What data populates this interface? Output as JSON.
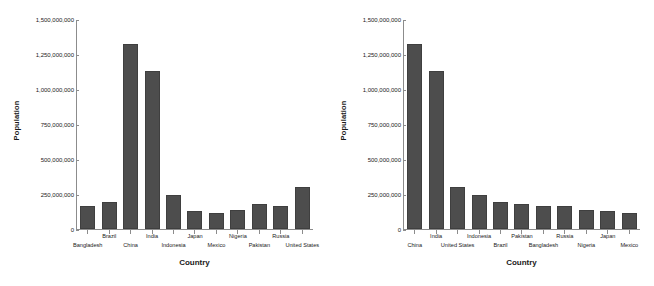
{
  "chart_data": [
    {
      "id": "left",
      "type": "bar",
      "title": "",
      "xlabel": "Country",
      "ylabel": "Population",
      "ylim": [
        0,
        1500000000
      ],
      "grid": false,
      "legend": null,
      "bar_color": "#4d4d4d",
      "sorted": "alphabetical",
      "ytick_labels": [
        "1,500,000,000",
        "1,250,000,000",
        "1,000,000,000",
        "750,000,000",
        "500,000,000",
        "250,000,000",
        "0"
      ],
      "ytick_values": [
        1500000000,
        1250000000,
        1000000000,
        750000000,
        500000000,
        250000000,
        0
      ],
      "categories": [
        "Bangladesh",
        "Brazil",
        "China",
        "India",
        "Indonesia",
        "Japan",
        "Mexico",
        "Nigeria",
        "Pakistan",
        "Russia",
        "United States"
      ],
      "values": [
        163000000,
        196000000,
        1330000000,
        1136000000,
        243000000,
        127000000,
        113000000,
        134000000,
        177000000,
        162000000,
        302000000
      ]
    },
    {
      "id": "right",
      "type": "bar",
      "title": "",
      "xlabel": "Country",
      "ylabel": "Population",
      "ylim": [
        0,
        1500000000
      ],
      "grid": false,
      "legend": null,
      "bar_color": "#4d4d4d",
      "sorted": "descending-by-value",
      "ytick_labels": [
        "1,500,000,000",
        "1,250,000,000",
        "1,000,000,000",
        "750,000,000",
        "500,000,000",
        "250,000,000",
        "0"
      ],
      "ytick_values": [
        1500000000,
        1250000000,
        1000000000,
        750000000,
        500000000,
        250000000,
        0
      ],
      "categories": [
        "China",
        "India",
        "United States",
        "Indonesia",
        "Brazil",
        "Pakistan",
        "Bangladesh",
        "Russia",
        "Nigeria",
        "Japan",
        "Mexico"
      ],
      "values": [
        1330000000,
        1136000000,
        302000000,
        243000000,
        196000000,
        177000000,
        163000000,
        162000000,
        134000000,
        127000000,
        113000000
      ]
    }
  ],
  "left_panel": {
    "ylabel": "Population",
    "xtitle": "Country"
  },
  "right_panel": {
    "ylabel": "Population",
    "xtitle": "Country"
  }
}
